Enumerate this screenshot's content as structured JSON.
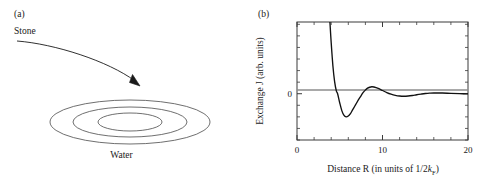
{
  "figure": {
    "panels": [
      {
        "key": "a",
        "label": "(a)",
        "type": "schematic",
        "annotations": {
          "stone": "Stone",
          "water": "Water"
        },
        "elements": {
          "arrow_name": "falling-stone-arrow",
          "ripple_count": 3
        }
      },
      {
        "key": "b",
        "label": "(b)",
        "type": "plot"
      }
    ]
  },
  "chart_data": {
    "type": "line",
    "title": "",
    "xlabel_parts": {
      "main": "Distance R (in units of 1/2",
      "italic": "k",
      "subscript": "F",
      "tail": ")"
    },
    "xlabel": "Distance R (in units of 1/2kF)",
    "ylabel": "Exchange J (arb. units)",
    "xlim": [
      0,
      20
    ],
    "ylim": [
      -1.0,
      1.55
    ],
    "xticks": [
      0,
      10,
      20
    ],
    "xtick_labels": [
      "0",
      "10",
      "20"
    ],
    "xminor_step": 2,
    "yticks": [
      0
    ],
    "ytick_labels": [
      "0"
    ],
    "yminor_step": 0.25,
    "grid": false,
    "legend": null,
    "zero_line": true,
    "zero_line_color": "#8c8c8c",
    "line_color": "#111111",
    "frame_color": "#3a3a3a",
    "series": [
      {
        "name": "RKKY exchange J(R)",
        "formula": "(sin(x) - x*cos(x))/x^4",
        "x": [
          3.85,
          4.0,
          4.2,
          4.4,
          4.6,
          4.75,
          5.0,
          5.25,
          5.5,
          5.75,
          6.0,
          6.25,
          6.5,
          6.75,
          7.0,
          7.25,
          7.5,
          7.75,
          8.0,
          8.25,
          8.5,
          8.75,
          9.0,
          9.5,
          10.0,
          10.5,
          11.0,
          11.5,
          12.0,
          12.5,
          13.0,
          13.5,
          14.0,
          14.5,
          15.0,
          15.5,
          16.0,
          17.0,
          18.0,
          19.0,
          20.0
        ],
        "y": [
          1.55,
          1.1,
          0.6,
          0.26,
          0.06,
          0.0,
          -0.2,
          -0.37,
          -0.47,
          -0.5,
          -0.48,
          -0.43,
          -0.35,
          -0.27,
          -0.19,
          -0.11,
          -0.04,
          0.03,
          0.08,
          0.12,
          0.14,
          0.15,
          0.145,
          0.115,
          0.07,
          0.025,
          -0.01,
          -0.035,
          -0.05,
          -0.055,
          -0.05,
          -0.038,
          -0.022,
          -0.008,
          0.004,
          0.012,
          0.016,
          0.015,
          0.007,
          0.001,
          -0.002
        ]
      }
    ]
  }
}
